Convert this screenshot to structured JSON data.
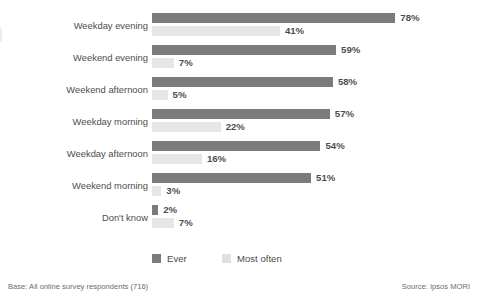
{
  "chart_data": {
    "type": "bar",
    "orientation": "horizontal",
    "title": "",
    "xlabel": "",
    "ylabel": "",
    "xlim": [
      0,
      80
    ],
    "grid": false,
    "legend_position": "bottom",
    "value_suffix": "%",
    "categories": [
      "Weekday evening",
      "Weekend evening",
      "Weekend afternoon",
      "Weekday morning",
      "Weekday afternoon",
      "Weekend morning",
      "Don't know"
    ],
    "series": [
      {
        "name": "Ever",
        "color": "#7b7b7b",
        "values": [
          78,
          59,
          58,
          57,
          54,
          51,
          2
        ],
        "labels": [
          "78%",
          "59%",
          "58%",
          "57%",
          "54%",
          "51%",
          "2%"
        ]
      },
      {
        "name": "Most often",
        "color": "#e6e6e6",
        "values": [
          41,
          7,
          5,
          22,
          16,
          3,
          7
        ],
        "labels": [
          "41%",
          "7%",
          "5%",
          "22%",
          "16%",
          "3%",
          "7%"
        ]
      }
    ]
  },
  "legend": {
    "items": [
      {
        "label": "Ever",
        "color": "#7b7b7b"
      },
      {
        "label": "Most often",
        "color": "#e0e0e0"
      }
    ]
  },
  "footer": {
    "base": "Base: All online survey respondents (716)",
    "source": "Source: Ipsos MORI"
  }
}
